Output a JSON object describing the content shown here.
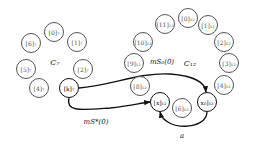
{
  "diagram": {
    "clusters": [
      {
        "id": "C7",
        "label": "C₇",
        "x": 55,
        "y": 62
      },
      {
        "id": "C12",
        "label": "C₁₂",
        "x": 190,
        "y": 63
      }
    ],
    "nodes": [
      {
        "id": "c7_0",
        "label": "[0]₇",
        "x": 54,
        "y": 32,
        "bold": false
      },
      {
        "id": "c7_1",
        "label": "[1]₇",
        "x": 77,
        "y": 42,
        "bold": false
      },
      {
        "id": "c7_2",
        "label": "[2]₇",
        "x": 83,
        "y": 69,
        "bold": false
      },
      {
        "id": "c7_k",
        "label": "[k]₇",
        "x": 69,
        "y": 88,
        "bold": true
      },
      {
        "id": "c7_4",
        "label": "[4]₇",
        "x": 39,
        "y": 88,
        "bold": false
      },
      {
        "id": "c7_5",
        "label": "[5]₇",
        "x": 26,
        "y": 69,
        "bold": false
      },
      {
        "id": "c7_6",
        "label": "[6]₇",
        "x": 31,
        "y": 43,
        "bold": false
      },
      {
        "id": "c12_0",
        "label": "[0]₁₂",
        "x": 188,
        "y": 18,
        "bold": false
      },
      {
        "id": "c12_1",
        "label": "[1]₁₂",
        "x": 208,
        "y": 25,
        "bold": false
      },
      {
        "id": "c12_2",
        "label": "[2]₁₂",
        "x": 224,
        "y": 42,
        "bold": false
      },
      {
        "id": "c12_3",
        "label": "[3]₁₂",
        "x": 229,
        "y": 63,
        "bold": false
      },
      {
        "id": "c12_4",
        "label": "[4]₁₂",
        "x": 224,
        "y": 85,
        "bold": false
      },
      {
        "id": "c12_x0",
        "label": "x₀]₁₂",
        "x": 207,
        "y": 102,
        "bold": true
      },
      {
        "id": "c12_6",
        "label": "[6]₁₂",
        "x": 182,
        "y": 108,
        "bold": false
      },
      {
        "id": "c12_x",
        "label": "[x]₁₂",
        "x": 160,
        "y": 102,
        "bold": true
      },
      {
        "id": "c12_8",
        "label": "[8]₁₂",
        "x": 140,
        "y": 86,
        "bold": false
      },
      {
        "id": "c12_9",
        "label": "[9]₁₂",
        "x": 134,
        "y": 63,
        "bold": false
      },
      {
        "id": "c12_10",
        "label": "[10]₁₂",
        "x": 143,
        "y": 42,
        "bold": false
      },
      {
        "id": "c12_11",
        "label": "[11]₁₂",
        "x": 165,
        "y": 24,
        "bold": false
      }
    ],
    "edges": [
      {
        "from": "c7_k",
        "to": "c12_x0",
        "label": "m_{S₀}^{(0)}",
        "label_text": "mS₀(0)",
        "label_x": 160,
        "label_y": 63
      },
      {
        "from": "c7_k",
        "to": "c12_x",
        "label": "m_{S*}^{(0)}",
        "label_text": "mS*(0)",
        "label_x": 96,
        "label_y": 122
      },
      {
        "from": "c12_x0",
        "to": "c12_x",
        "label": "a",
        "label_text": "a",
        "label_x": 182,
        "label_y": 136
      }
    ],
    "colors": {
      "bold_stroke": "#111111",
      "thin_stroke": "#555555",
      "background": "#ffffff"
    }
  }
}
